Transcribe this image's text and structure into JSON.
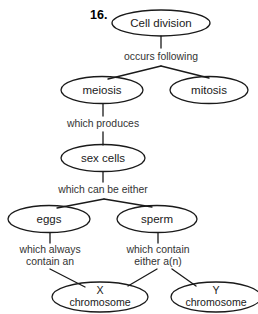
{
  "diagram": {
    "item_number": "16.",
    "type": "concept-map",
    "stroke_color": "#1a1a1a",
    "text_color": "#1a1a1a",
    "link_text_color": "#333333",
    "background_color": "#ffffff",
    "nodes": [
      {
        "id": "cell-division",
        "label": "Cell division",
        "cx": 161,
        "cy": 23,
        "rx": 49,
        "ry": 13
      },
      {
        "id": "meiosis",
        "label": "meiosis",
        "cx": 102,
        "cy": 90,
        "rx": 41,
        "ry": 13.5
      },
      {
        "id": "mitosis",
        "label": "mitosis",
        "cx": 209,
        "cy": 90,
        "rx": 39,
        "ry": 13.5
      },
      {
        "id": "sex-cells",
        "label": "sex cells",
        "cx": 103,
        "cy": 158,
        "rx": 42,
        "ry": 13.5
      },
      {
        "id": "eggs",
        "label": "eggs",
        "cx": 49,
        "cy": 219,
        "rx": 41,
        "ry": 13.5
      },
      {
        "id": "sperm",
        "label": "sperm",
        "cx": 157,
        "cy": 219,
        "rx": 40,
        "ry": 13.5
      },
      {
        "id": "x-chromosome",
        "label_line1": "X",
        "label_line2": "chromosome",
        "cx": 100,
        "cy": 297,
        "rx": 48,
        "ry": 15
      },
      {
        "id": "y-chromosome",
        "label_line1": "Y",
        "label_line2": "chromosome",
        "cx": 216,
        "cy": 297,
        "rx": 45,
        "ry": 15
      }
    ],
    "link_labels": [
      {
        "id": "occurs-following",
        "text": "occurs following",
        "x": 161,
        "y": 57
      },
      {
        "id": "which-produces",
        "text": "which produces",
        "x": 103,
        "y": 124
      },
      {
        "id": "which-can-be-either",
        "text": "which can be either",
        "x": 103,
        "y": 190
      },
      {
        "id": "which-always-contain-an-line1",
        "text": "which always",
        "x": 50,
        "y": 250
      },
      {
        "id": "which-always-contain-an-line2",
        "text": "contain an",
        "x": 50,
        "y": 262
      },
      {
        "id": "which-contain-either-an-line1",
        "text": "which contain",
        "x": 158,
        "y": 250
      },
      {
        "id": "which-contain-either-an-line2",
        "text": "either a(n)",
        "x": 158,
        "y": 262
      }
    ]
  }
}
